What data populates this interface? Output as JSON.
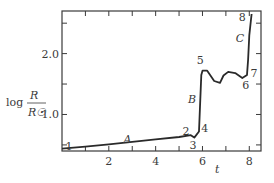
{
  "chart_data": {
    "type": "line",
    "title": "",
    "xlabel": "t",
    "ylabel": "log R/R☉",
    "ylabel_parts": {
      "prefix": "log",
      "numerator": "R",
      "denominator": "R☉"
    },
    "xlim": [
      0,
      8.5
    ],
    "ylim": [
      0.4,
      2.7
    ],
    "x_ticks": [
      1,
      2,
      3,
      4,
      5,
      6,
      7,
      8
    ],
    "x_tick_labels": [
      "2",
      "4",
      "6",
      "8"
    ],
    "x_tick_label_values": [
      2,
      4,
      6,
      8
    ],
    "y_ticks": [
      0.5,
      1.0,
      1.5,
      2.0,
      2.5
    ],
    "y_tick_labels": [
      "1.0",
      "2.0"
    ],
    "y_tick_label_values": [
      1.0,
      2.0
    ],
    "grid": false,
    "series": [
      {
        "name": "evolutionary track",
        "x": [
          0.0,
          1.0,
          2.0,
          3.0,
          4.0,
          5.0,
          5.5,
          5.65,
          5.85,
          5.95,
          6.0,
          6.2,
          6.5,
          6.75,
          6.9,
          7.1,
          7.4,
          7.7,
          7.9,
          7.95,
          8.0,
          8.1
        ],
        "y": [
          0.44,
          0.47,
          0.51,
          0.55,
          0.59,
          0.63,
          0.66,
          0.62,
          0.72,
          1.65,
          1.72,
          1.72,
          1.55,
          1.52,
          1.64,
          1.7,
          1.68,
          1.6,
          1.65,
          1.9,
          2.3,
          2.65
        ]
      }
    ],
    "annotations": [
      {
        "text": "1",
        "x": 0.3,
        "y": 0.48,
        "kind": "point"
      },
      {
        "text": "2",
        "x": 5.3,
        "y": 0.73,
        "kind": "point"
      },
      {
        "text": "3",
        "x": 5.6,
        "y": 0.5,
        "kind": "point"
      },
      {
        "text": "4",
        "x": 6.1,
        "y": 0.78,
        "kind": "point"
      },
      {
        "text": "5",
        "x": 5.9,
        "y": 1.9,
        "kind": "point"
      },
      {
        "text": "6",
        "x": 7.85,
        "y": 1.48,
        "kind": "point"
      },
      {
        "text": "7",
        "x": 8.2,
        "y": 1.68,
        "kind": "point"
      },
      {
        "text": "8",
        "x": 7.7,
        "y": 2.6,
        "kind": "point"
      },
      {
        "text": "A",
        "x": 2.8,
        "y": 0.6,
        "kind": "segment"
      },
      {
        "text": "B",
        "x": 5.55,
        "y": 1.25,
        "kind": "segment"
      },
      {
        "text": "C",
        "x": 7.6,
        "y": 2.25,
        "kind": "segment"
      }
    ],
    "legend": null
  }
}
